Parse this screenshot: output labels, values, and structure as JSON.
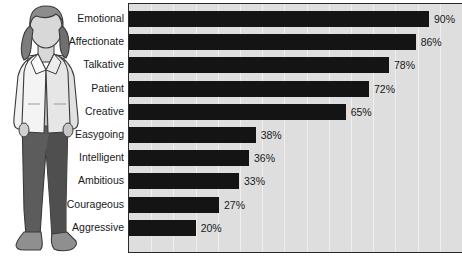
{
  "chart_data": {
    "type": "bar",
    "orientation": "horizontal",
    "title": "",
    "xlabel": "",
    "ylabel": "",
    "xlim": [
      0,
      100
    ],
    "grid": true,
    "gridline_axis": "x",
    "legend": false,
    "value_suffix": "%",
    "categories": [
      "Emotional",
      "Affectionate",
      "Talkative",
      "Patient",
      "Creative",
      "Easygoing",
      "Intelligent",
      "Ambitious",
      "Courageous",
      "Aggressive"
    ],
    "values": [
      90,
      86,
      78,
      72,
      65,
      38,
      36,
      33,
      27,
      20
    ],
    "value_labels": [
      "90%",
      "86%",
      "78%",
      "72%",
      "65%",
      "38%",
      "36%",
      "33%",
      "27%",
      "20%"
    ],
    "colors": {
      "bar": "#141414",
      "plot_background": "#dedede",
      "gridline": "#efefef",
      "axis": "#2a2a2a",
      "text": "#18181a",
      "page_background": "#ffffff"
    }
  },
  "illustration": {
    "name": "woman-standing-illustration",
    "colors": {
      "hair": "#8c8c8c",
      "hair_shadow": "#6f6f6f",
      "skin": "#d8d8d8",
      "jacket": "#f2f2f2",
      "jacket_shade": "#d2d2d2",
      "shirt": "#e8e8e8",
      "pants": "#5c5c5c",
      "pants_shade": "#4a4a4a",
      "shoes": "#8f8f8f",
      "outline": "#3a3a3a"
    }
  }
}
